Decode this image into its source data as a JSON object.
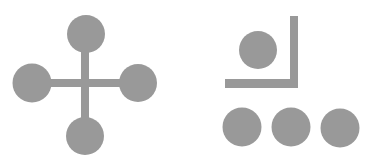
{
  "figure": {
    "width": 375,
    "height": 164,
    "background": "#ffffff",
    "fill_color": "#999999",
    "groups": [
      {
        "name": "cross-with-four-circles",
        "bars": [
          {
            "name": "vertical-bar",
            "x": 81,
            "y": 34,
            "w": 8,
            "h": 102
          },
          {
            "name": "horizontal-bar",
            "x": 32,
            "y": 79,
            "w": 106,
            "h": 8
          }
        ],
        "circles": [
          {
            "name": "top-circle",
            "cx": 86,
            "cy": 34,
            "r": 19
          },
          {
            "name": "left-circle",
            "cx": 32,
            "cy": 83,
            "r": 19.5
          },
          {
            "name": "right-circle",
            "cx": 138,
            "cy": 83,
            "r": 19
          },
          {
            "name": "bottom-circle",
            "cx": 85,
            "cy": 136,
            "r": 19
          }
        ]
      },
      {
        "name": "bracket-with-circles",
        "bars": [
          {
            "name": "bracket-vertical-bar",
            "x": 290,
            "y": 16,
            "w": 8,
            "h": 72
          },
          {
            "name": "bracket-horizontal-bar",
            "x": 225,
            "y": 79,
            "w": 73,
            "h": 9
          }
        ],
        "circles": [
          {
            "name": "inner-circle",
            "cx": 258,
            "cy": 50,
            "r": 19
          },
          {
            "name": "row-circle-1",
            "cx": 242,
            "cy": 127,
            "r": 19.5
          },
          {
            "name": "row-circle-2",
            "cx": 291,
            "cy": 127,
            "r": 19.5
          },
          {
            "name": "row-circle-3",
            "cx": 340,
            "cy": 128,
            "r": 19.5
          }
        ]
      }
    ]
  }
}
